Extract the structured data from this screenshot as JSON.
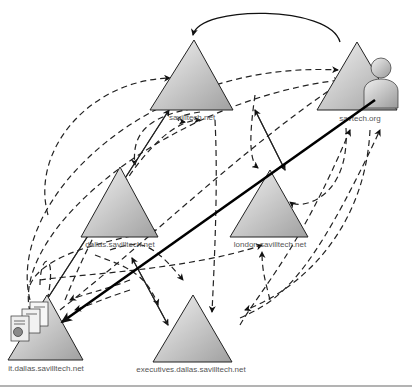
{
  "diagram": {
    "type": "active-directory-trust-diagram",
    "nodes": [
      {
        "id": "savilltech",
        "label": "savilltech.net",
        "kind": "domain-tree-root"
      },
      {
        "id": "savtech",
        "label": "savtech.org",
        "kind": "forest-external",
        "icon": "user-icon"
      },
      {
        "id": "dallas",
        "label": "dallas.savilltech.net",
        "kind": "child-domain"
      },
      {
        "id": "london",
        "label": "london.savilltech.net",
        "kind": "child-domain"
      },
      {
        "id": "it",
        "label": "it.dallas.savilltech.net",
        "kind": "grandchild-domain",
        "icon": "documents-icon"
      },
      {
        "id": "executives",
        "label": "executives.dallas.savilltech.net",
        "kind": "grandchild-domain"
      }
    ],
    "edges": [
      {
        "from": "savtech",
        "to": "savilltech",
        "style": "solid-curved",
        "meaning": "forest trust"
      },
      {
        "from": "savilltech",
        "to": "dallas",
        "style": "solid",
        "meaning": "parent-child trust"
      },
      {
        "from": "savilltech",
        "to": "london",
        "style": "solid",
        "meaning": "parent-child trust"
      },
      {
        "from": "dallas",
        "to": "it",
        "style": "solid",
        "meaning": "parent-child trust"
      },
      {
        "from": "dallas",
        "to": "executives",
        "style": "solid",
        "meaning": "parent-child trust"
      },
      {
        "from": "savtech",
        "to": "it",
        "style": "bold",
        "meaning": "user access path"
      },
      {
        "style": "dashed",
        "meaning": "transitive trust paths"
      }
    ],
    "colors": {
      "triangle_light": "#f2f2f2",
      "triangle_dark": "#a8a8a8",
      "stroke": "#222222",
      "label": "#555555",
      "rule": "#9a9a9a"
    }
  }
}
